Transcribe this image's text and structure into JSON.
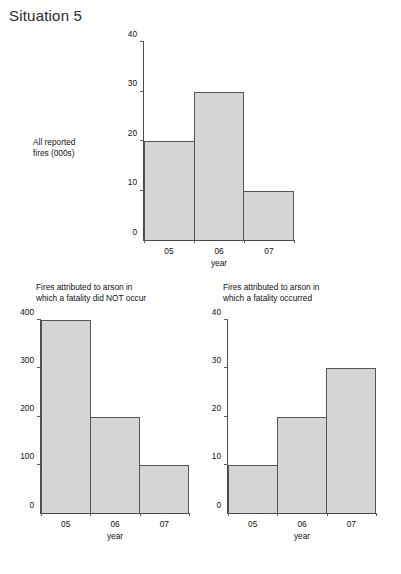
{
  "page": {
    "title": "Situation 5",
    "footer_clipped": ""
  },
  "chart_data": [
    {
      "id": "all-reported-fires",
      "type": "bar",
      "title": "",
      "side_label": "All reported\nfires (000s)",
      "categories": [
        "05",
        "06",
        "07"
      ],
      "values": [
        20,
        30,
        10
      ],
      "xlabel": "year",
      "ylabel": "",
      "ylim": [
        0,
        40
      ],
      "yticks": [
        0,
        10,
        20,
        30,
        40
      ],
      "grid": false,
      "legend": "none"
    },
    {
      "id": "arson-no-fatality",
      "type": "bar",
      "title": "Fires attributed to arson in\nwhich a fatality did NOT occur",
      "side_label": "",
      "categories": [
        "05",
        "06",
        "07"
      ],
      "values": [
        400,
        200,
        100
      ],
      "xlabel": "year",
      "ylabel": "",
      "ylim": [
        0,
        400
      ],
      "yticks": [
        0,
        100,
        200,
        300,
        400
      ],
      "grid": false,
      "legend": "none"
    },
    {
      "id": "arson-fatality",
      "type": "bar",
      "title": "Fires attributed to arson in\nwhich a fatality occurred",
      "side_label": "",
      "categories": [
        "05",
        "06",
        "07"
      ],
      "values": [
        10,
        20,
        30
      ],
      "xlabel": "year",
      "ylabel": "",
      "ylim": [
        0,
        40
      ],
      "yticks": [
        0,
        10,
        20,
        30,
        40
      ],
      "grid": false,
      "legend": "none"
    }
  ]
}
